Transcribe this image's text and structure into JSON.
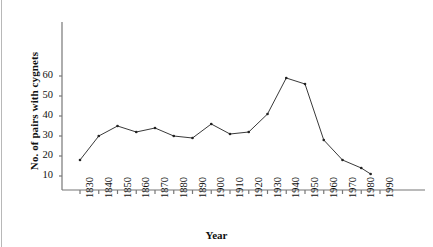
{
  "figure": {
    "ylabel": "No. of pairs with cygnets",
    "xlabel": "Year",
    "line_color": "#222222",
    "axis_color": "#777777",
    "border_color": "#b8b8b8"
  },
  "chart_data": {
    "type": "line",
    "title": "",
    "xlabel": "Year",
    "ylabel": "No. of pairs with cygnets",
    "xlim": [
      1825,
      1995
    ],
    "ylim": [
      0,
      68
    ],
    "grid": false,
    "legend": null,
    "x_ticks": [
      1830,
      1840,
      1850,
      1860,
      1870,
      1880,
      1890,
      1900,
      1910,
      1920,
      1930,
      1940,
      1950,
      1960,
      1970,
      1980,
      1990
    ],
    "y_ticks": [
      10,
      20,
      30,
      40,
      50,
      60
    ],
    "x": [
      1830,
      1840,
      1850,
      1860,
      1870,
      1880,
      1890,
      1900,
      1910,
      1920,
      1930,
      1940,
      1950,
      1960,
      1970,
      1980,
      1985
    ],
    "values": [
      18,
      30,
      35,
      32,
      34,
      30,
      29,
      36,
      31,
      32,
      41,
      59,
      56,
      28,
      18,
      14,
      11
    ],
    "marker": "dot",
    "series": [
      {
        "name": "No. of pairs with cygnets",
        "x": [
          1830,
          1840,
          1850,
          1860,
          1870,
          1880,
          1890,
          1900,
          1910,
          1920,
          1930,
          1940,
          1950,
          1960,
          1970,
          1980,
          1985
        ],
        "values": [
          18,
          30,
          35,
          32,
          34,
          30,
          29,
          36,
          31,
          32,
          41,
          59,
          56,
          28,
          18,
          14,
          11
        ]
      }
    ]
  }
}
